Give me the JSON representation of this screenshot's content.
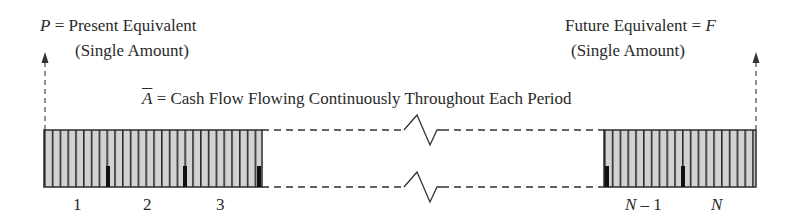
{
  "present": {
    "symbol": "P",
    "line1_rest": " = Present Equivalent",
    "line2": "(Single Amount)"
  },
  "future": {
    "line1_text": "Future Equivalent = ",
    "symbol": "F",
    "line2": "(Single Amount)"
  },
  "cashflow": {
    "symbol": "A",
    "rest": " = Cash Flow Flowing Continuously Throughout Each Period"
  },
  "periods": {
    "left": [
      "1",
      "2",
      "3"
    ],
    "right_nm1_symbol": "N",
    "right_nm1_rest": " – 1",
    "right_n": "N"
  },
  "colors": {
    "fill": "#d2d2d2",
    "stroke": "#2b2b2b",
    "dashed": "#555555"
  }
}
